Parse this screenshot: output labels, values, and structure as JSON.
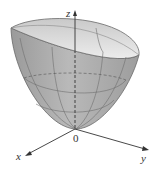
{
  "figure": {
    "type": "paraboloid",
    "axes": {
      "z_label": "z",
      "x_label": "x",
      "y_label": "y",
      "origin_label": "0"
    },
    "colors": {
      "surface": "#a9a9a9",
      "surface_light": "#d6d6d6",
      "rim_inner": "#e4e4e4",
      "axis": "#333333",
      "mesh": "#6f6f6f"
    }
  }
}
